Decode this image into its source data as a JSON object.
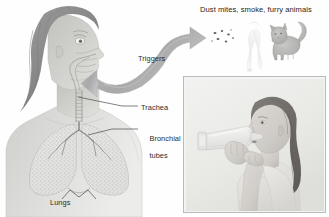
{
  "figure": {
    "type": "illustrated-medical-diagram",
    "background_color": "#ffffff",
    "palette": {
      "text": "#2b2b2b",
      "body_fill": "#d9d9d7",
      "hair": "#8d8d8d",
      "skin": "#c9c9c6",
      "lung_fill": "#e3e3e1",
      "lung_speckle": "#8f8f8f",
      "arrow": "#b0b0b0",
      "arrow_dark": "#939393",
      "leader_line": "#4a4a4a",
      "photo_border": "#b9bbbd",
      "photo_bg": "#efefec",
      "cat": "#b5b5b3",
      "smoke": "#e6e6e4",
      "dust": "#6e6e6e"
    }
  },
  "labels": {
    "header": "Dust mites, smoke, furry animals",
    "triggers": "Triggers",
    "trachea": "Trachea",
    "bronchial_tubes_line1": "Bronchial",
    "bronchial_tubes_line2": "tubes",
    "lungs": "Lungs"
  },
  "elements": {
    "person_illustration": "woman-head-profile-with-airway-cutaway-and-lungs",
    "curved_arrow": "double-headed-curved-arrow-between-face-and-triggers",
    "trigger_dust_mites": "scattered-dark-specks",
    "trigger_smoke": "faint-smoke-wisp",
    "trigger_cat": "standing-gray-cat",
    "photo": "grayscale-photo-girl-using-inhaler-with-spacer",
    "leader_line_trachea": "line-from-trachea-label-to-neck",
    "leader_line_bronchial": "line-from-bronchial-label-to-lung-branch",
    "leader_line_lungs": "v-shaped-line-from-lungs-label-to-lung-bases"
  }
}
